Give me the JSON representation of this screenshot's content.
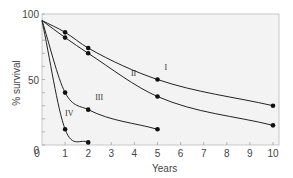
{
  "chart_data": {
    "type": "line",
    "title": "",
    "xlabel": "Years",
    "ylabel": "% survival",
    "xlim": [
      0,
      10
    ],
    "ylim": [
      0,
      100
    ],
    "x_ticks": [
      0,
      1,
      2,
      3,
      4,
      5,
      6,
      7,
      8,
      9,
      10
    ],
    "y_tick_labels": [
      0,
      50,
      100
    ],
    "y_minor_ticks_step": 10,
    "grid": false,
    "legend": "inline curve labels",
    "background": "#f3f3f3",
    "series": [
      {
        "name": "I",
        "x": [
          0,
          1,
          2,
          5,
          10
        ],
        "y": [
          95,
          86,
          74,
          50,
          30
        ]
      },
      {
        "name": "II",
        "x": [
          0,
          1,
          2,
          5,
          10
        ],
        "y": [
          95,
          82,
          70,
          37,
          15
        ]
      },
      {
        "name": "III",
        "x": [
          0,
          1,
          2,
          5
        ],
        "y": [
          95,
          40,
          27,
          12
        ]
      },
      {
        "name": "IV",
        "x": [
          0,
          1,
          2
        ],
        "y": [
          95,
          12,
          2
        ]
      }
    ],
    "label_positions": {
      "I": {
        "x": 5.3,
        "y": 57
      },
      "II": {
        "x": 3.85,
        "y": 53
      },
      "III": {
        "x": 2.3,
        "y": 34
      },
      "IV": {
        "x": 1.0,
        "y": 22
      }
    }
  }
}
